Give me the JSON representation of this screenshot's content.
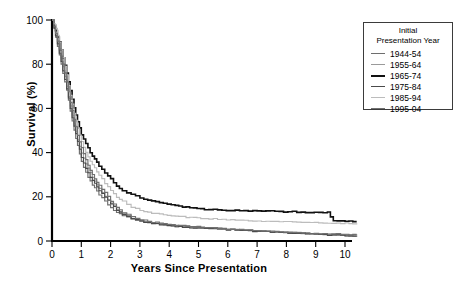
{
  "chart_data": {
    "type": "line",
    "title": "",
    "subtitle": "",
    "xlabel": "Years Since Presentation",
    "ylabel": "Survival (%)",
    "xlim": [
      0,
      10.5
    ],
    "ylim": [
      0,
      100
    ],
    "xticks": [
      0,
      1,
      2,
      3,
      4,
      5,
      6,
      7,
      8,
      9,
      10
    ],
    "yticks": [
      0,
      20,
      40,
      60,
      80,
      100
    ],
    "grid": false,
    "legend_position": "outside-right-top",
    "legend_title": [
      "Initial",
      "Presentation Year"
    ],
    "curve_style": "kaplan-meier step",
    "series": [
      {
        "name": "1944-54",
        "color": "#6e6e6e",
        "x": [
          0,
          0.12,
          0.25,
          0.37,
          0.5,
          0.62,
          0.75,
          0.87,
          1.0,
          1.15,
          1.3,
          1.45,
          1.6,
          1.8,
          2.0,
          2.2,
          2.4,
          2.7,
          3.0,
          3.4,
          3.8,
          4.2,
          4.7,
          5.2,
          5.8,
          6.4,
          7.0,
          7.6,
          8.2,
          8.8,
          9.4,
          10.0,
          10.4
        ],
        "y": [
          100,
          92,
          84,
          76,
          68,
          59,
          50,
          43,
          36,
          31,
          27,
          24,
          21,
          18,
          15,
          13,
          11.5,
          10,
          9,
          8.2,
          7.6,
          7.0,
          6.4,
          6.0,
          5.6,
          5.0,
          4.4,
          4.0,
          3.6,
          3.2,
          3.0,
          2.6,
          2.4
        ]
      },
      {
        "name": "1955-64",
        "color": "#9a9a9a",
        "x": [
          0,
          0.12,
          0.25,
          0.37,
          0.5,
          0.62,
          0.75,
          0.87,
          1.0,
          1.15,
          1.3,
          1.45,
          1.6,
          1.8,
          2.0,
          2.2,
          2.4,
          2.7,
          3.0,
          3.4,
          3.8,
          4.2,
          4.7,
          5.2,
          5.8,
          6.4,
          7.0,
          7.6,
          8.2,
          8.8,
          9.4,
          10.0,
          10.4
        ],
        "y": [
          100,
          93,
          86,
          79,
          70,
          61,
          53,
          46,
          40,
          35,
          31,
          27,
          24,
          20,
          17,
          14.5,
          12.5,
          10.5,
          9.2,
          8.0,
          7.2,
          6.6,
          6.2,
          5.8,
          5.4,
          5.0,
          4.6,
          4.2,
          3.8,
          3.4,
          3.0,
          2.8,
          2.6
        ]
      },
      {
        "name": "1965-74",
        "color": "#111111",
        "x": [
          0,
          0.12,
          0.25,
          0.37,
          0.5,
          0.62,
          0.75,
          0.87,
          1.0,
          1.15,
          1.3,
          1.45,
          1.6,
          1.8,
          2.0,
          2.2,
          2.4,
          2.7,
          3.0,
          3.4,
          3.8,
          4.2,
          4.7,
          5.2,
          5.8,
          6.4,
          7.0,
          7.6,
          8.2,
          8.8,
          9.4,
          9.6,
          10.0,
          10.4
        ],
        "y": [
          100,
          95,
          90,
          83,
          76,
          68,
          60,
          54,
          48,
          44,
          40,
          37,
          34,
          31,
          28,
          25,
          23,
          21,
          19.5,
          18,
          17,
          16,
          15,
          14.4,
          14.0,
          13.8,
          13.6,
          13.4,
          13.2,
          13.0,
          13.0,
          9.2,
          9.0,
          9.0
        ]
      },
      {
        "name": "1975-84",
        "color": "#4a4a4a",
        "x": [
          0,
          0.12,
          0.25,
          0.37,
          0.5,
          0.62,
          0.75,
          0.87,
          1.0,
          1.15,
          1.3,
          1.45,
          1.6,
          1.8,
          2.0,
          2.2,
          2.4,
          2.7,
          3.0,
          3.4,
          3.8,
          4.2,
          4.7,
          5.2,
          5.8,
          6.4,
          7.0,
          7.6,
          8.2,
          8.8,
          9.4,
          10.0,
          10.4
        ],
        "y": [
          100,
          93,
          85,
          77,
          69,
          60,
          52,
          45,
          38,
          33,
          29,
          26,
          23,
          20,
          17,
          14,
          12,
          10.2,
          9.0,
          8.0,
          7.2,
          6.6,
          6.0,
          5.6,
          5.2,
          4.8,
          4.4,
          4.0,
          3.6,
          3.2,
          2.8,
          2.4,
          2.2
        ]
      },
      {
        "name": "1985-94",
        "color": "#bcbcbc",
        "x": [
          0,
          0.12,
          0.25,
          0.37,
          0.5,
          0.62,
          0.75,
          0.87,
          1.0,
          1.15,
          1.3,
          1.45,
          1.6,
          1.8,
          2.0,
          2.2,
          2.4,
          2.7,
          3.0,
          3.4,
          3.8,
          4.2,
          4.7,
          5.2,
          5.8,
          6.4,
          7.0,
          7.6,
          8.2,
          8.8,
          9.4,
          10.0,
          10.4
        ],
        "y": [
          100,
          96,
          90,
          83,
          75,
          66,
          58,
          51,
          45,
          40,
          36,
          33,
          30,
          26,
          23,
          20,
          18,
          15.5,
          14,
          12.6,
          11.8,
          11.2,
          10.6,
          10.2,
          9.8,
          9.4,
          9.0,
          8.8,
          8.6,
          8.4,
          8.2,
          8.0,
          8.0
        ]
      },
      {
        "name": "1995-04",
        "color": "#707070",
        "x": [
          0,
          0.12,
          0.25,
          0.37,
          0.5,
          0.62,
          0.75,
          0.87,
          1.0,
          1.15,
          1.3,
          1.45,
          1.6,
          1.8,
          2.0,
          2.2,
          2.4,
          2.7,
          3.0,
          3.4,
          3.8,
          4.2,
          4.7,
          5.2,
          5.8,
          6.4,
          7.0,
          7.6,
          8.2,
          8.8,
          9.4,
          10.0,
          10.4
        ],
        "y": [
          100,
          94,
          87,
          80,
          72,
          63,
          55,
          48,
          42,
          37,
          32,
          28,
          25,
          22,
          18,
          15,
          13,
          11,
          9.6,
          8.6,
          7.8,
          7.2,
          6.6,
          6.2,
          5.6,
          5.0,
          4.6,
          4.2,
          3.8,
          3.4,
          3.2,
          3.0,
          2.8
        ]
      }
    ]
  },
  "legend": {
    "title_line1": "Initial",
    "title_line2": "Presentation Year",
    "items": [
      {
        "label": "1944-54",
        "color": "#6e6e6e"
      },
      {
        "label": "1955-64",
        "color": "#9a9a9a"
      },
      {
        "label": "1965-74",
        "color": "#111111"
      },
      {
        "label": "1975-84",
        "color": "#4a4a4a"
      },
      {
        "label": "1985-94",
        "color": "#bcbcbc"
      },
      {
        "label": "1995-04",
        "color": "#707070"
      }
    ]
  },
  "axes": {
    "x_title": "Years Since Presentation",
    "y_title": "Survival (%)"
  }
}
